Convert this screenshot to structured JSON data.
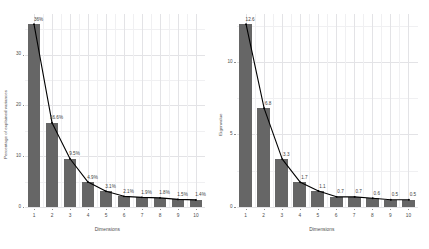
{
  "figure": {
    "background_color": "#ffffff",
    "bar_color": "#666666",
    "line_color": "#000000",
    "grid_color": "#e3e3e6",
    "text_color": "#4d4d4d"
  },
  "chart_data": [
    {
      "type": "bar",
      "title": "",
      "subtitle": "",
      "xlabel": "Dimensions",
      "ylabel": "Percentage of explained variances",
      "categories": [
        "1",
        "2",
        "3",
        "4",
        "5",
        "6",
        "7",
        "8",
        "9",
        "10"
      ],
      "values": [
        36,
        16.6,
        9.5,
        4.9,
        3.1,
        2.1,
        1.9,
        1.8,
        1.5,
        1.4
      ],
      "data_labels": [
        "36%",
        "16.6%",
        "9.5%",
        "4.9%",
        "3.1%",
        "2.1%",
        "1.9%",
        "1.8%",
        "1.5%",
        "1.4%"
      ],
      "series": [
        {
          "name": "bars",
          "kind": "bar",
          "values": [
            36,
            16.6,
            9.5,
            4.9,
            3.1,
            2.1,
            1.9,
            1.8,
            1.5,
            1.4
          ]
        },
        {
          "name": "scree-line",
          "kind": "line",
          "values": [
            36,
            16.6,
            9.5,
            4.9,
            3.1,
            2.1,
            1.9,
            1.8,
            1.5,
            1.4
          ]
        }
      ],
      "ylim": [
        0,
        38
      ],
      "yticks": [
        "0",
        "10",
        "20",
        "30"
      ],
      "ytick_values": [
        0,
        10,
        20,
        30
      ],
      "xticks": [
        "1",
        "2",
        "3",
        "4",
        "5",
        "6",
        "7",
        "8",
        "9",
        "10"
      ],
      "grid": true,
      "legend": "none"
    },
    {
      "type": "bar",
      "title": "",
      "subtitle": "",
      "xlabel": "Dimensions",
      "ylabel": "Eigenvalue",
      "categories": [
        "1",
        "2",
        "3",
        "4",
        "5",
        "6",
        "7",
        "8",
        "9",
        "10"
      ],
      "values": [
        12.6,
        6.8,
        3.3,
        1.7,
        1.1,
        0.7,
        0.7,
        0.6,
        0.5,
        0.5
      ],
      "data_labels": [
        "12.6",
        "6.8",
        "3.3",
        "1.7",
        "1.1",
        "0.7",
        "0.7",
        "0.6",
        "0.5",
        "0.5"
      ],
      "series": [
        {
          "name": "bars",
          "kind": "bar",
          "values": [
            12.6,
            6.8,
            3.3,
            1.7,
            1.1,
            0.7,
            0.7,
            0.6,
            0.5,
            0.5
          ]
        },
        {
          "name": "scree-line",
          "kind": "line",
          "values": [
            12.6,
            6.8,
            3.3,
            1.7,
            1.1,
            0.7,
            0.7,
            0.6,
            0.5,
            0.5
          ]
        }
      ],
      "ylim": [
        0,
        13.3
      ],
      "yticks": [
        "0",
        "5",
        "10"
      ],
      "ytick_values": [
        0,
        5,
        10
      ],
      "xticks": [
        "1",
        "2",
        "3",
        "4",
        "5",
        "6",
        "7",
        "8",
        "9",
        "10"
      ],
      "grid": true,
      "legend": "none"
    }
  ]
}
